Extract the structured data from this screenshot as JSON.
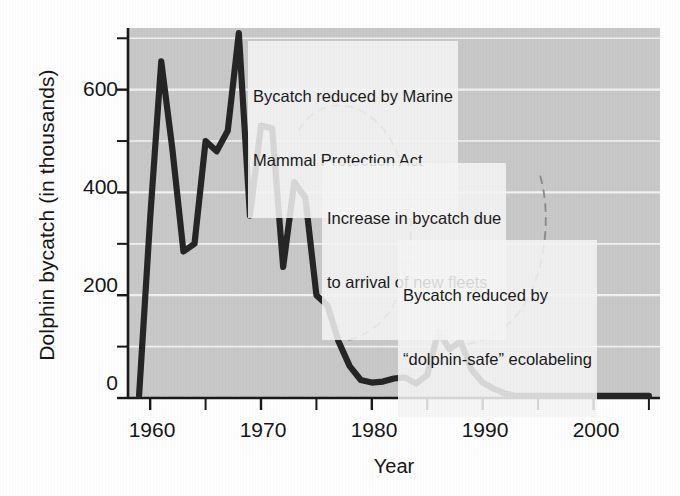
{
  "chart_data": {
    "type": "line",
    "title": "",
    "xlabel": "Year",
    "ylabel": "Dolphin bycatch (in thousands)",
    "xlim": [
      1958,
      2006
    ],
    "ylim": [
      0,
      720
    ],
    "grid": true,
    "legend_position": "none",
    "x_ticks_major": [
      1960,
      1970,
      1980,
      1990,
      2000
    ],
    "x_ticks_minor": [
      1965,
      1975,
      1985,
      1995,
      2005
    ],
    "y_ticks_major": [
      0,
      200,
      400,
      600
    ],
    "y_ticks_minor": [
      100,
      300,
      500,
      700
    ],
    "x_tick_labels": [
      "1960",
      "1970",
      "1980",
      "1990",
      "2000"
    ],
    "y_tick_labels": [
      "0",
      "200",
      "400",
      "600"
    ],
    "series": [
      {
        "name": "Dolphin bycatch",
        "color": "#262626",
        "x": [
          1959,
          1960,
          1961,
          1962,
          1963,
          1964,
          1965,
          1966,
          1967,
          1968,
          1969,
          1970,
          1971,
          1972,
          1973,
          1974,
          1975,
          1976,
          1977,
          1978,
          1979,
          1980,
          1981,
          1982,
          1983,
          1984,
          1985,
          1986,
          1987,
          1988,
          1989,
          1990,
          1991,
          1992,
          1993,
          1994,
          1995,
          1996,
          1997,
          1998,
          1999,
          2000,
          2001,
          2002,
          2003,
          2004,
          2005
        ],
        "y": [
          5,
          350,
          655,
          485,
          285,
          300,
          500,
          480,
          520,
          710,
          355,
          530,
          525,
          255,
          420,
          390,
          200,
          180,
          110,
          62,
          35,
          30,
          32,
          38,
          40,
          28,
          45,
          130,
          95,
          110,
          55,
          30,
          18,
          9,
          4,
          4,
          4,
          4,
          4,
          4,
          4,
          4,
          4,
          4,
          4,
          4,
          4
        ]
      }
    ],
    "annotations": [
      {
        "id": "mmpa",
        "lines": [
          "Bycatch reduced by Marine",
          "Mammal Protection Act"
        ],
        "points_to_year": 1972
      },
      {
        "id": "new-fleets",
        "lines": [
          "Increase in bycatch due",
          "to arrival of new fleets"
        ],
        "points_to_year": 1986
      },
      {
        "id": "dolphin-safe",
        "lines": [
          "Bycatch reduced by",
          "“dolphin-safe” ecolabeling"
        ],
        "points_to_year": 1990
      }
    ]
  },
  "figure": {
    "plot_bg_color": "#c9c9c9",
    "page_bg_color": "#ffffff",
    "gridline_color": "#f2f2f2",
    "axis_color": "#1a1a1a",
    "line_color": "#262626",
    "leader_color": "#8c8c8c",
    "annotation_bg_color": "#f6f6f6"
  },
  "ghost_text": {
    "lines": [
      "                                                                          ",
      "                                                                          ",
      "                                                                          "
    ]
  }
}
